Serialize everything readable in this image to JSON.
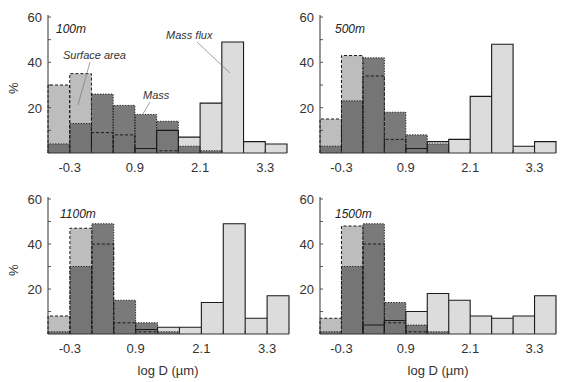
{
  "figure": {
    "xlabel": "log D (µm)",
    "ylabel": "%"
  },
  "colors": {
    "surface_area": "#bdbdbd",
    "mass": "#6f6f6f",
    "mass_flux": "#dcdcdc",
    "outline": "#1a1a1a"
  },
  "chart_data": [
    {
      "type": "bar",
      "title": "100m",
      "xlabel": "",
      "ylabel": "%",
      "ylim": [
        0,
        60
      ],
      "yticks": [
        20,
        40,
        60
      ],
      "xticks": [
        "-0.3",
        "0.9",
        "2.1",
        "3.3"
      ],
      "bin_edges": [
        -0.7,
        -0.3,
        0.1,
        0.5,
        0.9,
        1.3,
        1.7,
        2.1,
        2.5,
        2.9,
        3.3,
        3.7
      ],
      "series": [
        {
          "name": "Surface area",
          "values": [
            30,
            35,
            9,
            8,
            0,
            1,
            0,
            0,
            0,
            0,
            0
          ]
        },
        {
          "name": "Mass",
          "values": [
            4,
            13,
            26,
            21,
            17,
            14,
            3,
            1,
            0,
            0,
            0
          ]
        },
        {
          "name": "Mass flux",
          "values": [
            0,
            0,
            0,
            0,
            2,
            10,
            7,
            22,
            49,
            5,
            4
          ]
        }
      ],
      "annotations": [
        "Surface area",
        "Mass",
        "Mass flux"
      ]
    },
    {
      "type": "bar",
      "title": "500m",
      "xlabel": "",
      "ylabel": "",
      "ylim": [
        0,
        60
      ],
      "yticks": [
        20,
        40,
        60
      ],
      "xticks": [
        "-0.3",
        "0.9",
        "2.1",
        "3.3"
      ],
      "bin_edges": [
        -0.7,
        -0.3,
        0.1,
        0.5,
        0.9,
        1.3,
        1.7,
        2.1,
        2.5,
        2.9,
        3.3,
        3.7
      ],
      "series": [
        {
          "name": "Surface area",
          "values": [
            15,
            43,
            34,
            6,
            0,
            0,
            0,
            0,
            0,
            0,
            0
          ]
        },
        {
          "name": "Mass",
          "values": [
            3,
            23,
            42,
            18,
            8,
            4,
            0,
            0,
            0,
            0,
            0
          ]
        },
        {
          "name": "Mass flux",
          "values": [
            0,
            0,
            0,
            0,
            2,
            5,
            6,
            25,
            48,
            3,
            5
          ]
        }
      ]
    },
    {
      "type": "bar",
      "title": "1100m",
      "xlabel": "log D (µm)",
      "ylabel": "%",
      "ylim": [
        0,
        60
      ],
      "yticks": [
        20,
        40,
        60
      ],
      "xticks": [
        "-0.3",
        "0.9",
        "2.1",
        "3.3"
      ],
      "bin_edges": [
        -0.7,
        -0.3,
        0.1,
        0.5,
        0.9,
        1.3,
        1.7,
        2.1,
        2.5,
        2.9,
        3.3,
        3.7
      ],
      "series": [
        {
          "name": "Surface area",
          "values": [
            8,
            47,
            40,
            5,
            1,
            0,
            0,
            0,
            0,
            0,
            0
          ]
        },
        {
          "name": "Mass",
          "values": [
            1,
            30,
            49,
            15,
            5,
            1,
            0,
            0,
            0,
            0,
            0
          ]
        },
        {
          "name": "Mass flux",
          "values": [
            0,
            0,
            0,
            0,
            2,
            3,
            3,
            14,
            49,
            7,
            17
          ]
        }
      ]
    },
    {
      "type": "bar",
      "title": "1500m",
      "xlabel": "log D (µm)",
      "ylabel": "",
      "ylim": [
        0,
        60
      ],
      "yticks": [
        20,
        40,
        60
      ],
      "xticks": [
        "-0.3",
        "0.9",
        "2.1",
        "3.3"
      ],
      "bin_edges": [
        -0.7,
        -0.3,
        0.1,
        0.5,
        0.9,
        1.3,
        1.7,
        2.1,
        2.5,
        2.9,
        3.3,
        3.7
      ],
      "series": [
        {
          "name": "Surface area",
          "values": [
            7,
            48,
            40,
            5,
            1,
            0,
            0,
            0,
            0,
            0,
            0
          ]
        },
        {
          "name": "Mass",
          "values": [
            1,
            30,
            49,
            14,
            4,
            1,
            0,
            0,
            0,
            0,
            0
          ]
        },
        {
          "name": "Mass flux",
          "values": [
            0,
            0,
            4,
            6,
            10,
            18,
            15,
            8,
            7,
            8,
            17
          ]
        }
      ]
    }
  ],
  "panels": [
    {
      "title": "100m",
      "yticks": [
        "20",
        "40",
        "60"
      ],
      "xticks": [
        "-0.3",
        "0.9",
        "2.1",
        "3.3"
      ]
    },
    {
      "title": "500m",
      "yticks": [
        "20",
        "40",
        "60"
      ],
      "xticks": [
        "-0.3",
        "0.9",
        "2.1",
        "3.3"
      ]
    },
    {
      "title": "1100m",
      "yticks": [
        "20",
        "40",
        "60"
      ],
      "xticks": [
        "-0.3",
        "0.9",
        "2.1",
        "3.3"
      ]
    },
    {
      "title": "1500m",
      "yticks": [
        "20",
        "40",
        "60"
      ],
      "xticks": [
        "-0.3",
        "0.9",
        "2.1",
        "3.3"
      ]
    }
  ],
  "annotations": {
    "surface_area": "Surface area",
    "mass": "Mass",
    "mass_flux": "Mass flux"
  }
}
